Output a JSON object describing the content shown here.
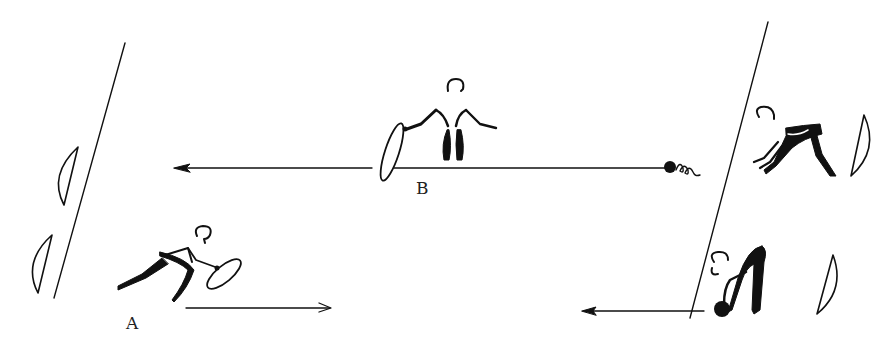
{
  "diagram": {
    "type": "exercise-illustration",
    "labels": {
      "a": "A",
      "b": "B"
    },
    "colors": {
      "ink": "#111111",
      "background": "#ffffff"
    },
    "elements": [
      {
        "id": "left-boundary-line",
        "kind": "line"
      },
      {
        "id": "right-boundary-line",
        "kind": "line"
      },
      {
        "id": "mat-left-upper",
        "kind": "half-disc"
      },
      {
        "id": "mat-left-lower",
        "kind": "half-disc"
      },
      {
        "id": "mat-right-upper",
        "kind": "half-disc"
      },
      {
        "id": "mat-right-lower",
        "kind": "half-disc"
      },
      {
        "id": "figure-a-lunging-with-hoop",
        "kind": "figure"
      },
      {
        "id": "figure-b-standing-with-hoop",
        "kind": "figure"
      },
      {
        "id": "figure-bending-forward",
        "kind": "figure"
      },
      {
        "id": "figure-bending-over-ball",
        "kind": "figure"
      },
      {
        "id": "arrow-top-leftward",
        "kind": "arrow",
        "direction": "left"
      },
      {
        "id": "arrow-bottom-rightward",
        "kind": "arrow",
        "direction": "right"
      },
      {
        "id": "arrow-bottom-leftward",
        "kind": "arrow",
        "direction": "left"
      },
      {
        "id": "ball-rolling",
        "kind": "ball"
      }
    ]
  }
}
